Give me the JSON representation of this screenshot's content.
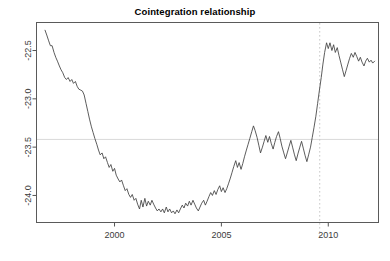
{
  "chart_data": {
    "type": "line",
    "title": "Cointegration relationship",
    "xlabel": "",
    "ylabel": "",
    "xlim": [
      1996.35,
      2012.35
    ],
    "ylim": [
      -24.28,
      -22.21
    ],
    "grid": false,
    "legend": null,
    "xticks": [
      2000,
      2005,
      2010
    ],
    "xtick_labels": [
      "2000",
      "2005",
      "2010"
    ],
    "yticks": [
      -22.5,
      -23.0,
      -23.5,
      -24.0
    ],
    "ytick_labels": [
      "-22.5",
      "-23.0",
      "-23.5",
      "-24.0"
    ],
    "annotations": [
      {
        "name": "mean-level-line",
        "type": "hline",
        "y": -23.42,
        "color": "#d9d9d9",
        "style": "solid"
      },
      {
        "name": "breakpoint-line",
        "type": "vline",
        "x": 2009.6,
        "color": "#c8c8c8",
        "style": "dotted"
      }
    ],
    "series": [
      {
        "name": "cointegration-residual",
        "color": "#404040",
        "x": [
          1996.75,
          1996.83,
          1996.92,
          1997.0,
          1997.08,
          1997.17,
          1997.25,
          1997.33,
          1997.42,
          1997.5,
          1997.58,
          1997.67,
          1997.75,
          1997.83,
          1997.92,
          1998.0,
          1998.08,
          1998.17,
          1998.25,
          1998.33,
          1998.42,
          1998.5,
          1998.58,
          1998.67,
          1998.75,
          1998.83,
          1998.92,
          1999.0,
          1999.08,
          1999.17,
          1999.25,
          1999.33,
          1999.42,
          1999.5,
          1999.58,
          1999.67,
          1999.75,
          1999.83,
          1999.92,
          2000.0,
          2000.08,
          2000.17,
          2000.25,
          2000.33,
          2000.42,
          2000.5,
          2000.58,
          2000.67,
          2000.75,
          2000.83,
          2000.92,
          2001.0,
          2001.08,
          2001.17,
          2001.25,
          2001.33,
          2001.42,
          2001.5,
          2001.58,
          2001.67,
          2001.75,
          2001.83,
          2001.92,
          2002.0,
          2002.08,
          2002.17,
          2002.25,
          2002.33,
          2002.42,
          2002.5,
          2002.58,
          2002.67,
          2002.75,
          2002.83,
          2002.92,
          2003.0,
          2003.08,
          2003.17,
          2003.25,
          2003.33,
          2003.42,
          2003.5,
          2003.58,
          2003.67,
          2003.75,
          2003.83,
          2003.92,
          2004.0,
          2004.08,
          2004.17,
          2004.25,
          2004.33,
          2004.42,
          2004.5,
          2004.58,
          2004.67,
          2004.75,
          2004.83,
          2004.92,
          2005.0,
          2005.08,
          2005.17,
          2005.25,
          2005.33,
          2005.42,
          2005.5,
          2005.58,
          2005.67,
          2005.75,
          2005.83,
          2005.92,
          2006.0,
          2006.08,
          2006.17,
          2006.25,
          2006.33,
          2006.42,
          2006.5,
          2006.58,
          2006.67,
          2006.75,
          2006.83,
          2006.92,
          2007.0,
          2007.08,
          2007.17,
          2007.25,
          2007.33,
          2007.42,
          2007.5,
          2007.58,
          2007.67,
          2007.75,
          2007.83,
          2007.92,
          2008.0,
          2008.08,
          2008.17,
          2008.25,
          2008.33,
          2008.42,
          2008.5,
          2008.58,
          2008.67,
          2008.75,
          2008.83,
          2008.92,
          2009.0,
          2009.08,
          2009.17,
          2009.25,
          2009.33,
          2009.42,
          2009.5,
          2009.58,
          2009.67,
          2009.75,
          2009.83,
          2009.92,
          2010.0,
          2010.08,
          2010.17,
          2010.25,
          2010.33,
          2010.42,
          2010.5,
          2010.58,
          2010.67,
          2010.75,
          2010.83,
          2010.92,
          2011.0,
          2011.08,
          2011.17,
          2011.25,
          2011.33,
          2011.42,
          2011.5,
          2011.58,
          2011.67,
          2011.75,
          2011.83,
          2011.92,
          2012.0,
          2012.08,
          2012.17
        ],
        "y": [
          -22.29,
          -22.34,
          -22.4,
          -22.45,
          -22.45,
          -22.52,
          -22.57,
          -22.61,
          -22.66,
          -22.7,
          -22.73,
          -22.78,
          -22.8,
          -22.78,
          -22.82,
          -22.8,
          -22.84,
          -22.82,
          -22.87,
          -22.9,
          -22.91,
          -22.92,
          -22.96,
          -23.05,
          -23.13,
          -23.21,
          -23.29,
          -23.35,
          -23.41,
          -23.47,
          -23.53,
          -23.58,
          -23.56,
          -23.62,
          -23.6,
          -23.66,
          -23.71,
          -23.68,
          -23.75,
          -23.72,
          -23.79,
          -23.83,
          -23.86,
          -23.84,
          -23.9,
          -23.95,
          -23.93,
          -23.99,
          -24.02,
          -23.99,
          -24.05,
          -24.03,
          -24.09,
          -24.14,
          -24.05,
          -24.12,
          -24.03,
          -24.11,
          -24.06,
          -24.1,
          -24.05,
          -24.09,
          -24.13,
          -24.16,
          -24.14,
          -24.17,
          -24.14,
          -24.18,
          -24.12,
          -24.17,
          -24.14,
          -24.18,
          -24.16,
          -24.19,
          -24.15,
          -24.18,
          -24.14,
          -24.1,
          -24.13,
          -24.08,
          -24.11,
          -24.06,
          -24.1,
          -24.05,
          -24.09,
          -24.13,
          -24.16,
          -24.12,
          -24.08,
          -24.05,
          -24.1,
          -24.06,
          -24.01,
          -23.97,
          -24.0,
          -23.95,
          -23.99,
          -23.94,
          -23.9,
          -23.96,
          -23.92,
          -23.97,
          -23.93,
          -23.88,
          -23.82,
          -23.76,
          -23.7,
          -23.64,
          -23.71,
          -23.66,
          -23.73,
          -23.67,
          -23.6,
          -23.53,
          -23.47,
          -23.41,
          -23.34,
          -23.28,
          -23.33,
          -23.4,
          -23.48,
          -23.56,
          -23.5,
          -23.44,
          -23.38,
          -23.45,
          -23.39,
          -23.46,
          -23.52,
          -23.45,
          -23.39,
          -23.34,
          -23.41,
          -23.49,
          -23.56,
          -23.62,
          -23.56,
          -23.49,
          -23.43,
          -23.5,
          -23.58,
          -23.64,
          -23.57,
          -23.5,
          -23.44,
          -23.51,
          -23.59,
          -23.65,
          -23.58,
          -23.5,
          -23.4,
          -23.3,
          -23.18,
          -23.05,
          -22.92,
          -22.78,
          -22.64,
          -22.52,
          -22.42,
          -22.48,
          -22.42,
          -22.5,
          -22.44,
          -22.52,
          -22.47,
          -22.55,
          -22.62,
          -22.7,
          -22.77,
          -22.71,
          -22.64,
          -22.58,
          -22.53,
          -22.57,
          -22.52,
          -22.56,
          -22.61,
          -22.57,
          -22.62,
          -22.66,
          -22.61,
          -22.58,
          -22.62,
          -22.6,
          -22.63,
          -22.61
        ]
      }
    ]
  },
  "axis": {
    "box_color": "#555555",
    "tick_color": "#555555"
  }
}
